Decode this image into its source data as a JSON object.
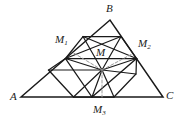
{
  "figure": {
    "background_color": "#ffffff",
    "stroke_color": "#1a1a1a",
    "dash_color": "#8c8c8c",
    "width": 181,
    "height": 121
  },
  "labels": {
    "A": "A",
    "B": "B",
    "C": "C",
    "M": "M",
    "M1_base": "M",
    "M1_sub": "1",
    "M2_base": "M",
    "M2_sub": "2",
    "M3_base": "M",
    "M3_sub": "3"
  },
  "points": {
    "A": {
      "x": 21,
      "y": 97
    },
    "B": {
      "x": 110,
      "y": 20
    },
    "C": {
      "x": 163,
      "y": 97
    },
    "M1": {
      "x": 65.5,
      "y": 58.5
    },
    "M2": {
      "x": 136.5,
      "y": 58.5
    },
    "M3": {
      "x": 92,
      "y": 97
    },
    "M": {
      "x": 102,
      "y": 70
    }
  },
  "geometry": {
    "outer_triangle": "A-B-C",
    "medial_triangle": "M1-M2-M3",
    "center_point": "M",
    "squares": [
      {
        "name": "square-on-M1M2",
        "base": "M1-M2"
      },
      {
        "name": "square-on-M1M3",
        "base": "M1-M3"
      },
      {
        "name": "square-on-M2M3",
        "base": "M2-M3"
      }
    ],
    "dashed_segments": [
      "M-to-M1",
      "M-to-M2",
      "M-to-M3"
    ]
  },
  "style": {
    "line_width_outer": 1.4,
    "line_width_inner": 1.1,
    "dash_pattern": "3 2"
  }
}
